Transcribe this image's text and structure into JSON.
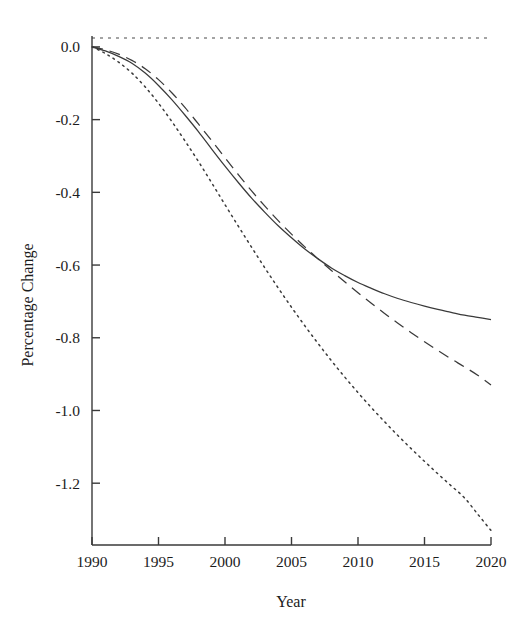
{
  "chart_data": {
    "type": "line",
    "title": "",
    "subtitle": "",
    "xlabel": "Year",
    "ylabel": "Percentage Change",
    "xlim": [
      1990,
      2020
    ],
    "ylim": [
      -1.37,
      0.03
    ],
    "grid": false,
    "legend": "none",
    "background": "#ffffff",
    "line_color": "#3a3a3a",
    "axis_color": "#3a3a3a",
    "x_ticks": [
      1990,
      1995,
      2000,
      2005,
      2010,
      2015,
      2020
    ],
    "x_tick_labels": [
      "1990",
      "1995",
      "2000",
      "2005",
      "2010",
      "2015",
      "2020"
    ],
    "y_ticks": [
      0.0,
      -0.2,
      -0.4,
      -0.6,
      -0.8,
      -1.0,
      -1.2
    ],
    "y_tick_labels": [
      "0.0",
      "-0.2",
      "-0.4",
      "-0.6",
      "-0.8",
      "-1.0",
      "-1.2"
    ],
    "annotations": [
      {
        "name": "zero-reference-line",
        "type": "hline",
        "y": 0.0,
        "style": "dotted"
      }
    ],
    "x": [
      1990,
      1991,
      1992,
      1993,
      1994,
      1995,
      1996,
      1997,
      1998,
      1999,
      2000,
      2001,
      2002,
      2003,
      2004,
      2005,
      2006,
      2007,
      2008,
      2009,
      2010,
      2011,
      2012,
      2013,
      2014,
      2015,
      2016,
      2017,
      2018,
      2019,
      2020
    ],
    "series": [
      {
        "name": "solid-curve",
        "style": "solid",
        "values": [
          0.0,
          -0.011,
          -0.026,
          -0.045,
          -0.072,
          -0.106,
          -0.145,
          -0.188,
          -0.233,
          -0.281,
          -0.328,
          -0.373,
          -0.416,
          -0.455,
          -0.492,
          -0.525,
          -0.556,
          -0.583,
          -0.608,
          -0.629,
          -0.648,
          -0.664,
          -0.679,
          -0.692,
          -0.703,
          -0.713,
          -0.722,
          -0.73,
          -0.738,
          -0.744,
          -0.75
        ]
      },
      {
        "name": "dashed-curve",
        "style": "dashed",
        "values": [
          0.0,
          -0.008,
          -0.02,
          -0.037,
          -0.06,
          -0.09,
          -0.126,
          -0.167,
          -0.212,
          -0.258,
          -0.305,
          -0.351,
          -0.396,
          -0.438,
          -0.478,
          -0.515,
          -0.55,
          -0.583,
          -0.615,
          -0.646,
          -0.676,
          -0.705,
          -0.733,
          -0.76,
          -0.786,
          -0.811,
          -0.835,
          -0.858,
          -0.88,
          -0.903,
          -0.93
        ]
      },
      {
        "name": "dotted-curve",
        "style": "dotted",
        "values": [
          0.0,
          -0.018,
          -0.042,
          -0.072,
          -0.11,
          -0.155,
          -0.205,
          -0.259,
          -0.315,
          -0.374,
          -0.434,
          -0.493,
          -0.551,
          -0.608,
          -0.663,
          -0.716,
          -0.767,
          -0.816,
          -0.863,
          -0.908,
          -0.951,
          -0.992,
          -1.031,
          -1.069,
          -1.105,
          -1.14,
          -1.174,
          -1.207,
          -1.24,
          -1.285,
          -1.33
        ]
      }
    ]
  }
}
